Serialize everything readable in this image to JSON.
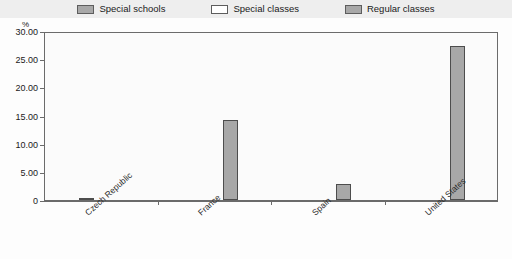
{
  "legend": {
    "entries": [
      {
        "label": "Special schools",
        "swatch": "#a8a8a8",
        "icon": "legend-swatch-icon"
      },
      {
        "label": "Special classes",
        "swatch": "#ffffff",
        "icon": "legend-swatch-icon"
      },
      {
        "label": "Regular classes",
        "swatch": "#a8a8a8",
        "icon": "legend-swatch-icon"
      }
    ]
  },
  "axis": {
    "y_unit": "%",
    "y_ticks": [
      "30.00",
      "25.00",
      "20.00",
      "15.00",
      "10.00",
      "5.00",
      "0"
    ]
  },
  "chart_data": {
    "type": "bar",
    "title": "",
    "xlabel": "",
    "ylabel": "%",
    "ylim": [
      0,
      30
    ],
    "grid": false,
    "legend_position": "top",
    "categories": [
      "Czech Republic",
      "France",
      "Spain",
      "United States"
    ],
    "series": [
      {
        "name": "Special schools",
        "color": "#a8a8a8",
        "values": [
          0.2,
          0,
          0,
          0
        ]
      },
      {
        "name": "Special classes",
        "color": "#ffffff",
        "values": [
          0,
          0,
          0,
          0
        ]
      },
      {
        "name": "Regular classes",
        "color": "#a8a8a8",
        "values": [
          0,
          14.2,
          2.8,
          27.3
        ]
      }
    ]
  }
}
